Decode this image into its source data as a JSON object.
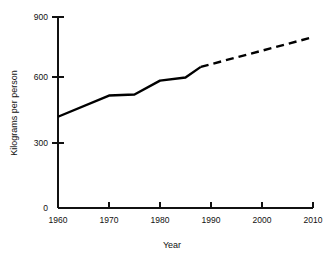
{
  "chart_data": {
    "type": "line",
    "title": "",
    "subtitle": "",
    "xlabel": "Year",
    "ylabel": "Kilograms per person",
    "xlim": [
      1960,
      2010
    ],
    "ylim": [
      0,
      900
    ],
    "xticks": [
      1960,
      1970,
      1980,
      1990,
      2000,
      2010
    ],
    "xtick_labels": [
      "1960",
      "1970",
      "1980",
      "1990",
      "2000",
      "2010"
    ],
    "yticks": [
      0,
      300,
      600,
      900
    ],
    "ytick_labels": [
      "0",
      "300",
      "600",
      "900"
    ],
    "grid": false,
    "legend": false,
    "legend_position": "none",
    "line_color": "#000000",
    "series": [
      {
        "name": "Observed",
        "style": "solid",
        "x": [
          1960,
          1970,
          1975,
          1980,
          1985,
          1988
        ],
        "values": [
          430,
          530,
          535,
          600,
          615,
          665
        ]
      },
      {
        "name": "Projected",
        "style": "dashed",
        "x": [
          1988,
          2010
        ],
        "values": [
          665,
          805
        ]
      }
    ]
  },
  "axis": {
    "y_title": "Kilograms per person",
    "x_title": "Year"
  },
  "ticks": {
    "y": [
      "900",
      "600",
      "300",
      "0"
    ],
    "x": [
      "1960",
      "1970",
      "1980",
      "1990",
      "2000",
      "2010"
    ]
  }
}
